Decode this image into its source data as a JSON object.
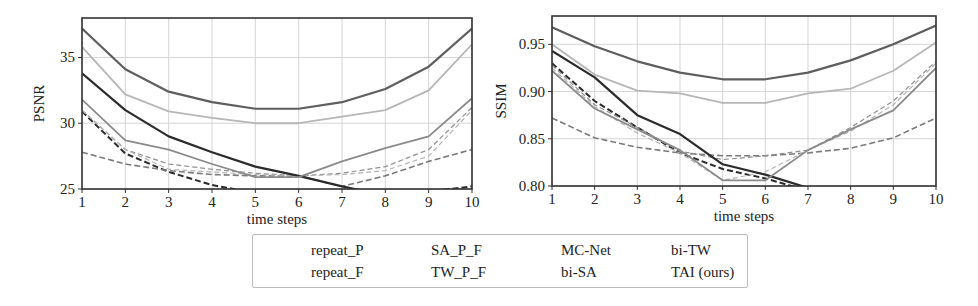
{
  "chart_data": [
    {
      "type": "line",
      "title": "",
      "xlabel": "time steps",
      "ylabel": "PSNR",
      "x": [
        1,
        2,
        3,
        4,
        5,
        6,
        7,
        8,
        9,
        10
      ],
      "xlim": [
        1,
        10
      ],
      "ylim": [
        25,
        38
      ],
      "yticks": [
        25,
        30,
        35
      ],
      "xticks": [
        1,
        2,
        3,
        4,
        5,
        6,
        7,
        8,
        9,
        10
      ],
      "grid": true,
      "series": [
        {
          "name": "repeat_P",
          "values": [
            30.9,
            27.7,
            26.3,
            25.3,
            24.7,
            24.2,
            23.8,
            24.2,
            24.8,
            25.2
          ]
        },
        {
          "name": "repeat_F",
          "values": [
            27.8,
            26.9,
            26.4,
            26.1,
            26.0,
            26.0,
            25.2,
            26.0,
            27.1,
            28.0
          ]
        },
        {
          "name": "SA_P_F",
          "values": [
            31.0,
            28.0,
            26.9,
            26.5,
            26.2,
            26.0,
            26.2,
            26.7,
            28.0,
            31.2
          ]
        },
        {
          "name": "TW_P_F",
          "values": [
            31.0,
            28.0,
            26.5,
            26.3,
            26.1,
            26.0,
            26.1,
            26.4,
            27.5,
            31.0
          ]
        },
        {
          "name": "MC-Net",
          "values": [
            33.8,
            31.0,
            29.0,
            27.8,
            26.7,
            26.0,
            25.2,
            24.5,
            24.0,
            23.8
          ]
        },
        {
          "name": "bi-SA",
          "values": [
            31.8,
            28.7,
            28.0,
            26.9,
            25.9,
            25.9,
            27.1,
            28.1,
            29.0,
            31.9
          ]
        },
        {
          "name": "bi-TW",
          "values": [
            35.8,
            32.2,
            30.9,
            30.4,
            30.0,
            30.0,
            30.5,
            31.0,
            32.5,
            36.0
          ]
        },
        {
          "name": "TAI (ours)",
          "values": [
            37.2,
            34.1,
            32.4,
            31.6,
            31.1,
            31.1,
            31.6,
            32.6,
            34.3,
            37.2
          ]
        }
      ]
    },
    {
      "type": "line",
      "title": "",
      "xlabel": "time steps",
      "ylabel": "SSIM",
      "x": [
        1,
        2,
        3,
        4,
        5,
        6,
        7,
        8,
        9,
        10
      ],
      "xlim": [
        1,
        10
      ],
      "ylim": [
        0.8,
        0.98
      ],
      "yticks": [
        0.8,
        0.85,
        0.9,
        0.95
      ],
      "xticks": [
        1,
        2,
        3,
        4,
        5,
        6,
        7,
        8,
        9,
        10
      ],
      "grid": true,
      "series": [
        {
          "name": "repeat_P",
          "values": [
            0.93,
            0.89,
            0.862,
            0.835,
            0.818,
            0.808,
            0.795,
            0.79,
            0.79,
            0.795
          ]
        },
        {
          "name": "repeat_F",
          "values": [
            0.872,
            0.851,
            0.841,
            0.835,
            0.832,
            0.832,
            0.835,
            0.84,
            0.851,
            0.872
          ]
        },
        {
          "name": "SA_P_F",
          "values": [
            0.928,
            0.886,
            0.862,
            0.837,
            0.828,
            0.832,
            0.838,
            0.862,
            0.89,
            0.932
          ]
        },
        {
          "name": "TW_P_F",
          "values": [
            0.925,
            0.884,
            0.856,
            0.835,
            0.806,
            0.815,
            0.838,
            0.858,
            0.886,
            0.93
          ]
        },
        {
          "name": "MC-Net",
          "values": [
            0.943,
            0.915,
            0.875,
            0.855,
            0.823,
            0.812,
            0.798,
            0.79,
            0.788,
            0.79
          ]
        },
        {
          "name": "bi-SA",
          "values": [
            0.922,
            0.882,
            0.86,
            0.838,
            0.806,
            0.806,
            0.838,
            0.86,
            0.88,
            0.925
          ]
        },
        {
          "name": "bi-TW",
          "values": [
            0.95,
            0.918,
            0.901,
            0.898,
            0.888,
            0.888,
            0.898,
            0.903,
            0.922,
            0.952
          ]
        },
        {
          "name": "TAI (ours)",
          "values": [
            0.968,
            0.948,
            0.932,
            0.92,
            0.913,
            0.913,
            0.92,
            0.933,
            0.95,
            0.97
          ]
        }
      ]
    }
  ],
  "styles": {
    "repeat_P": {
      "color": "#2a2a2a",
      "dash": "6,3",
      "width": 2.0
    },
    "repeat_F": {
      "color": "#7a7a7a",
      "dash": "6,3",
      "width": 1.6
    },
    "SA_P_F": {
      "color": "#8e8e8e",
      "dash": "5,3",
      "width": 1.2
    },
    "TW_P_F": {
      "color": "#b4b4b4",
      "dash": "5,3",
      "width": 1.2
    },
    "MC-Net": {
      "color": "#2b2b2b",
      "dash": "",
      "width": 2.2
    },
    "bi-SA": {
      "color": "#8a8a8a",
      "dash": "",
      "width": 1.8
    },
    "bi-TW": {
      "color": "#b6b6b6",
      "dash": "",
      "width": 1.8
    },
    "TAI (ours)": {
      "color": "#5e5e5e",
      "dash": "",
      "width": 2.2
    }
  },
  "legend": {
    "items": [
      {
        "label": "repeat_P"
      },
      {
        "label": "repeat_F"
      },
      {
        "label": "SA_P_F"
      },
      {
        "label": "TW_P_F"
      },
      {
        "label": "MC-Net"
      },
      {
        "label": "bi-SA"
      },
      {
        "label": "bi-TW"
      },
      {
        "label": "TAI (ours)"
      }
    ]
  }
}
